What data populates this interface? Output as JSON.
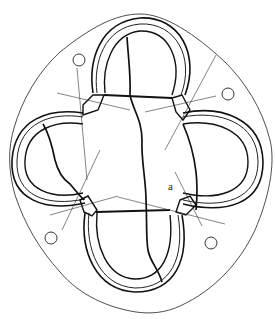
{
  "figure": {
    "width": 275,
    "height": 319,
    "label": "a",
    "colors": {
      "background": "#ffffff",
      "line": "#111111"
    },
    "lobes": [
      "top",
      "right",
      "bottom",
      "left"
    ],
    "mounting_holes": 4,
    "cracks": 3
  }
}
